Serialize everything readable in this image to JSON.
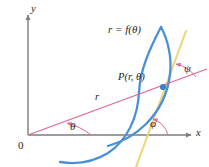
{
  "figure": {
    "background_color": "#ffffff",
    "width": 209,
    "height": 167
  },
  "axes": {
    "x_label": "x",
    "y_label": "y",
    "origin_label": "0",
    "color": "#7d7d7d",
    "x_axis_y": 135,
    "y_axis_x": 28
  },
  "labels": {
    "curve_equation": "r = f(θ)",
    "point": "P(r, θ)",
    "radius": "r",
    "theta": "θ",
    "phi": "φ",
    "psi": "ψ"
  },
  "elements": {
    "curve": {
      "name": "polar-curve",
      "color": "#4a90d9",
      "stroke_width": 2.2
    },
    "radial_line": {
      "name": "radial-line",
      "color": "#e0649a",
      "stroke_width": 1.1
    },
    "tangent_line": {
      "name": "tangent-line",
      "color": "#f0d47a",
      "stroke_width": 2.0
    },
    "point_marker": {
      "name": "point-p",
      "color": "#3b82c4",
      "radius": 3.0,
      "x": 163,
      "y": 87
    },
    "angle_arcs": {
      "color": "#e0649a",
      "stroke_width": 1.0
    }
  }
}
